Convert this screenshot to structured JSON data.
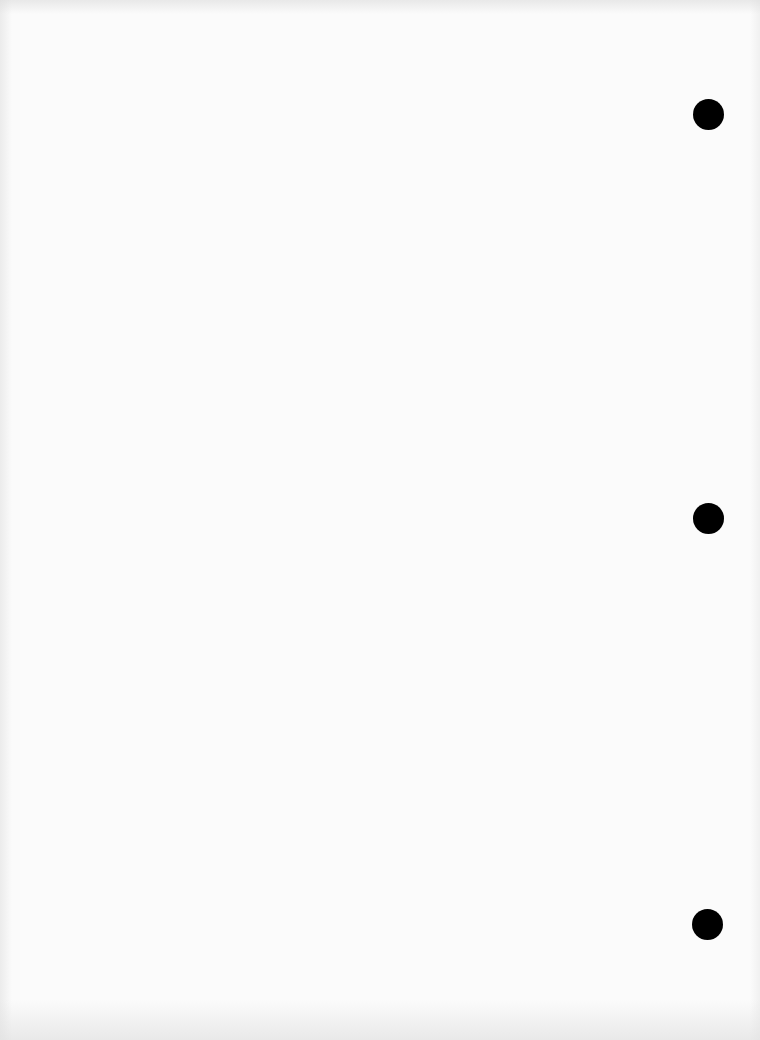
{
  "page": {
    "type": "scanned-blank-page",
    "background_color": "#fbfbfb",
    "content_text": "",
    "bleed_through": {
      "heading": "",
      "lines": []
    }
  },
  "punch_holes": [
    {
      "cx": 708,
      "cy": 114,
      "r": 15,
      "color": "#000000"
    },
    {
      "cx": 708,
      "cy": 518,
      "r": 15,
      "color": "#000000"
    },
    {
      "cx": 707,
      "cy": 924,
      "r": 15,
      "color": "#000000"
    }
  ]
}
